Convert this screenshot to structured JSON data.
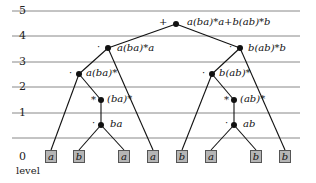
{
  "levels": [
    "0",
    "1",
    "2",
    "3",
    "4",
    "5"
  ],
  "level_axis_label": "level",
  "root": {
    "op": "+",
    "label": "a(ba)*a+b(ab)*b"
  },
  "left": {
    "l4": {
      "op": "·",
      "label": "a(ba)*a"
    },
    "l3": {
      "op": "·",
      "label": "a(ba)*"
    },
    "l2": {
      "op": "*",
      "label": "(ba)*"
    },
    "l1": {
      "op": "·",
      "label": "ba"
    }
  },
  "right": {
    "l4": {
      "op": "·",
      "label": "b(ab)*b"
    },
    "l3": {
      "op": "·",
      "label": "b(ab)*"
    },
    "l2": {
      "op": "*",
      "label": "(ab)*"
    },
    "l1": {
      "op": "·",
      "label": "ab"
    }
  },
  "leaves": [
    "a",
    "b",
    "a",
    "a",
    "b",
    "a",
    "b",
    "b"
  ]
}
